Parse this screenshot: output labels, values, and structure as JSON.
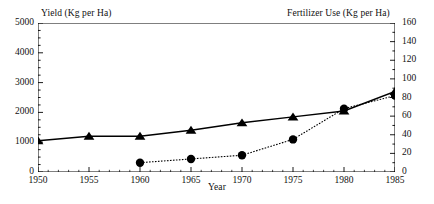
{
  "chart_data": {
    "type": "line",
    "title": "",
    "xlabel": "Year",
    "x": [
      1950,
      1955,
      1960,
      1965,
      1970,
      1975,
      1980,
      1985
    ],
    "xtick_labels": [
      "1950",
      "1955",
      "1960",
      "1965",
      "1970",
      "1975",
      "1980",
      "1985"
    ],
    "xlim": [
      1950,
      1985
    ],
    "grid": false,
    "legend_position": "none",
    "axes": [
      {
        "id": "left",
        "label": "Yield (Kg per Ha)",
        "ylim": [
          0,
          5000
        ],
        "ticks": [
          0,
          1000,
          2000,
          3000,
          4000,
          5000
        ],
        "tick_labels": [
          "0",
          "1000",
          "2000",
          "3000",
          "4000",
          "5000"
        ],
        "minor_tick_step": 250
      },
      {
        "id": "right",
        "label": "Fertilizer Use (Kg per Ha)",
        "ylim": [
          0,
          160
        ],
        "ticks": [
          0,
          20,
          40,
          60,
          80,
          100,
          120,
          140,
          160
        ],
        "tick_labels": [
          "0",
          "20",
          "40",
          "60",
          "80",
          "100",
          "120",
          "140",
          "160"
        ],
        "minor_tick_step": 10
      }
    ],
    "series": [
      {
        "name": "Yield",
        "axis": "left",
        "marker": "triangle",
        "line_style": "solid",
        "color": "#000000",
        "x": [
          1950,
          1955,
          1960,
          1965,
          1970,
          1975,
          1980,
          1985
        ],
        "values": [
          1050,
          1200,
          1200,
          1400,
          1650,
          1850,
          2050,
          2700
        ]
      },
      {
        "name": "Fertilizer Use",
        "axis": "right",
        "marker": "circle",
        "line_style": "dotted",
        "color": "#000000",
        "x": [
          1960,
          1965,
          1970,
          1975,
          1980,
          1985
        ],
        "values": [
          10,
          14,
          18,
          35,
          68,
          82
        ]
      }
    ]
  }
}
